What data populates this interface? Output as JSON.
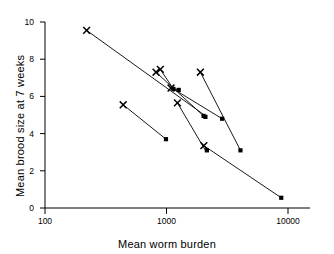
{
  "figure": {
    "title": "",
    "background_color": "#ffffff",
    "foreground_color": "#000000"
  },
  "axes": {
    "x": {
      "label": "Mean worm burden",
      "scale": "log",
      "range": [
        100,
        10000
      ],
      "ticks": [
        {
          "value": 100,
          "label": "100"
        },
        {
          "value": 1000,
          "label": "1000"
        },
        {
          "value": 10000,
          "label": "10000"
        }
      ]
    },
    "y": {
      "label": "Mean brood size at 7 weeks",
      "scale": "linear",
      "range": [
        0,
        10
      ],
      "ticks": [
        {
          "value": 0,
          "label": "0"
        },
        {
          "value": 2,
          "label": "2"
        },
        {
          "value": 4,
          "label": "4"
        },
        {
          "value": 6,
          "label": "6"
        },
        {
          "value": 8,
          "label": "8"
        },
        {
          "value": 10,
          "label": "10"
        }
      ]
    }
  },
  "markers": {
    "cross": {
      "name": "cross-marker",
      "symbol": "x",
      "color": "#000000"
    },
    "square": {
      "name": "square-marker",
      "symbol": "filled-square",
      "color": "#000000"
    }
  },
  "chart_data": {
    "type": "scatter",
    "title": "",
    "xlabel": "Mean worm burden",
    "ylabel": "Mean brood size at 7 weeks",
    "xscale": "log",
    "yscale": "linear",
    "xlim": [
      100,
      10000
    ],
    "ylim": [
      0,
      10
    ],
    "grid": false,
    "legend": "none",
    "xticks": [
      100,
      1000,
      10000
    ],
    "yticks": [
      0,
      2,
      4,
      6,
      8,
      10
    ],
    "series": [
      {
        "name": "cross-points",
        "marker": "x",
        "x": [
          220,
          440,
          820,
          890,
          1090,
          1230,
          1900,
          2030
        ],
        "y": [
          9.55,
          5.55,
          7.3,
          7.45,
          6.45,
          5.65,
          7.3,
          3.35
        ]
      },
      {
        "name": "square-points",
        "marker": "filled-square",
        "x": [
          990,
          1140,
          1260,
          2020,
          2090,
          2150,
          2870,
          4060,
          8800
        ],
        "y": [
          3.7,
          6.4,
          6.35,
          4.95,
          4.9,
          3.1,
          4.8,
          3.1,
          0.55
        ]
      }
    ],
    "connections": [
      {
        "id": "pair-1",
        "from": {
          "x": 220,
          "y": 9.55,
          "marker": "x"
        },
        "to": {
          "x": 2150,
          "y": 4.9,
          "marker": "filled-square"
        }
      },
      {
        "id": "pair-2",
        "from": {
          "x": 440,
          "y": 5.55,
          "marker": "x"
        },
        "to": {
          "x": 990,
          "y": 3.7,
          "marker": "filled-square"
        }
      },
      {
        "id": "pair-3",
        "from": {
          "x": 820,
          "y": 7.3,
          "marker": "x"
        },
        "to": {
          "x": 2020,
          "y": 4.95,
          "marker": "filled-square"
        }
      },
      {
        "id": "pair-4",
        "from": {
          "x": 890,
          "y": 7.45,
          "marker": "x"
        },
        "to": {
          "x": 1140,
          "y": 6.4,
          "marker": "filled-square"
        }
      },
      {
        "id": "pair-5",
        "from": {
          "x": 1090,
          "y": 6.45,
          "marker": "x"
        },
        "to": {
          "x": 1260,
          "y": 6.35,
          "marker": "filled-square"
        }
      },
      {
        "id": "pair-6",
        "from": {
          "x": 1230,
          "y": 5.65,
          "marker": "x"
        },
        "to": {
          "x": 2090,
          "y": 3.1,
          "marker": "filled-square"
        }
      },
      {
        "id": "pair-7",
        "from": {
          "x": 1900,
          "y": 7.3,
          "marker": "x"
        },
        "to": {
          "x": 4060,
          "y": 3.1,
          "marker": "filled-square"
        }
      },
      {
        "id": "pair-8",
        "from": {
          "x": 2030,
          "y": 3.35,
          "marker": "x"
        },
        "to": {
          "x": 8800,
          "y": 0.55,
          "marker": "filled-square"
        }
      },
      {
        "id": "pair-9",
        "from": {
          "x": 1140,
          "y": 6.4,
          "marker": "filled-square"
        },
        "to": {
          "x": 2870,
          "y": 4.8,
          "marker": "filled-square"
        }
      }
    ]
  }
}
